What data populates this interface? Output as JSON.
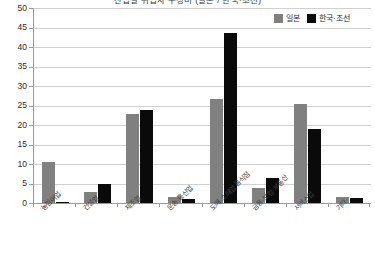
{
  "chart_data": {
    "type": "bar",
    "title": "산업별 취업자 구성비 (일본 / 한국·조선)",
    "xlabel": "",
    "ylabel": "",
    "ylim": [
      0,
      50
    ],
    "ytick_step": 5,
    "ytick_labels": [
      "0",
      "5",
      "10",
      "15",
      "20",
      "25",
      "30",
      "35",
      "40",
      "45",
      "50"
    ],
    "grid": "horizontal",
    "legend_position": "top-right",
    "categories": [
      "농림어업",
      "건설업",
      "제조업",
      "운송·통신업",
      "도매·소매업 음식점",
      "금융·보험·부동산",
      "서비스업",
      "기타"
    ],
    "series": [
      {
        "name": "일본",
        "color": "#808080",
        "values": [
          10.5,
          2.8,
          22.8,
          1.6,
          26.6,
          3.9,
          25.5,
          1.6
        ]
      },
      {
        "name": "한국·조선",
        "color": "#0a0a0a",
        "values": [
          0.3,
          4.8,
          23.8,
          1.0,
          43.5,
          6.3,
          19.0,
          1.3
        ]
      }
    ]
  }
}
